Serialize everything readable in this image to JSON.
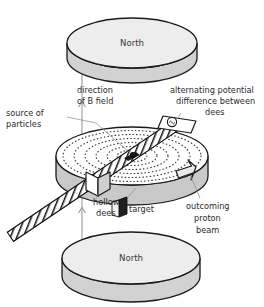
{
  "diagram": {
    "type": "physics-apparatus-diagram"
  },
  "magnets": {
    "top": {
      "label": "North",
      "name": "top-magnet-pole"
    },
    "bottom": {
      "label": "North",
      "name": "bottom-magnet-pole"
    }
  },
  "labels": {
    "b_field_line1": "direction",
    "b_field_line2": "of B field",
    "source_line1": "source of",
    "source_line2": "particles",
    "alternating_line1": "alternating potential",
    "alternating_line2": "difference between",
    "alternating_line3": "dees",
    "hollow_line1": "hollow",
    "hollow_line2": "dees",
    "target": "target",
    "beam_line1": "outcoming",
    "beam_line2": "proton",
    "beam_line3": "beam"
  },
  "icons": {
    "ac_source": "ac-source-icon",
    "b_field_arrow": "up-arrow-icon",
    "beam_arrow": "beam-arrow-icon",
    "particle_source": "particle-source-icon",
    "target_block": "target-block-icon"
  },
  "colors": {
    "magnet_face": "#ededed",
    "magnet_side": "#d2d2d2",
    "dee_face": "#ffffff",
    "dee_side": "#c9c9c9",
    "outline": "#1a1a1a",
    "leader": "#8a8a8a",
    "text": "#2b2b2b",
    "spiral_dots": "#3a3a3a",
    "target_fill": "#2a2a2a"
  },
  "geometry": {
    "spiral_turns": 6,
    "dee_gap_angle_deg": -34,
    "view": "isometric"
  }
}
